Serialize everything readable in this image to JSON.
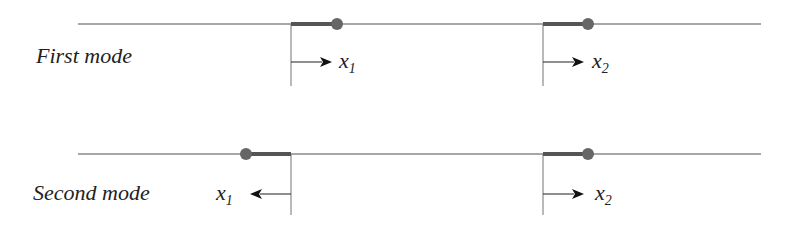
{
  "diagram": {
    "rows": [
      {
        "label": "First mode",
        "line_y": 24,
        "masses": [
          {
            "anchor_x": 291,
            "mass_x": 337,
            "arrow_dir": "right",
            "var": "x",
            "sub": "1"
          },
          {
            "anchor_x": 543,
            "mass_x": 588,
            "arrow_dir": "right",
            "var": "x",
            "sub": "2"
          }
        ]
      },
      {
        "label": "Second mode",
        "line_y": 154,
        "masses": [
          {
            "anchor_x": 291,
            "mass_x": 246,
            "arrow_dir": "left",
            "var": "x",
            "sub": "1"
          },
          {
            "anchor_x": 543,
            "mass_x": 588,
            "arrow_dir": "right",
            "var": "x",
            "sub": "2"
          }
        ]
      }
    ],
    "colors": {
      "line": "#8a8a8a",
      "rod": "#555555",
      "mass": "#666666",
      "arrow": "#111111",
      "text": "#222222"
    }
  }
}
